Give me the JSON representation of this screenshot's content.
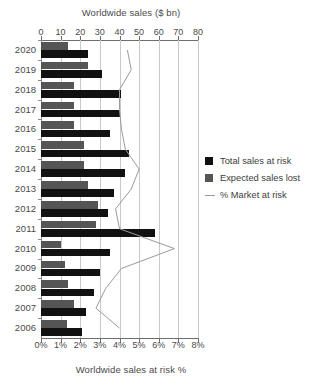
{
  "chart_data": {
    "type": "bar",
    "title": "",
    "orientation": "horizontal",
    "top_axis": {
      "label": "Worldwide sales ($ bn)",
      "ticks": [
        0,
        10,
        20,
        30,
        40,
        50,
        60,
        70,
        80
      ],
      "tick_labels": [
        "0",
        "10",
        "20",
        "30",
        "40",
        "50",
        "60",
        "70",
        "80"
      ],
      "range": [
        0,
        80
      ]
    },
    "bottom_axis": {
      "label": "Worldwide sales at risk %",
      "ticks": [
        0,
        1,
        2,
        3,
        4,
        5,
        6,
        7,
        8
      ],
      "tick_labels": [
        "0%",
        "1%",
        "2%",
        "3%",
        "4%",
        "5%",
        "6%",
        "7%",
        "8%"
      ],
      "range": [
        0,
        8
      ]
    },
    "categories": [
      "2020",
      "2019",
      "2018",
      "2017",
      "2016",
      "2015",
      "2014",
      "2013",
      "2012",
      "2011",
      "2010",
      "2009",
      "2008",
      "2007",
      "2006"
    ],
    "ylabel": "",
    "xlabel": "Worldwide sales ($ bn)",
    "grid": true,
    "legend_position": "right",
    "series": [
      {
        "name": "Total sales at risk",
        "type": "bar",
        "axis": "top",
        "color": "#111111",
        "unit": "$ bn",
        "values": [
          24,
          31,
          41,
          40,
          35,
          45,
          43,
          37,
          34,
          58,
          35,
          30,
          27,
          23,
          21
        ]
      },
      {
        "name": "Expected sales lost",
        "type": "bar",
        "axis": "top",
        "color": "#555555",
        "unit": "$ bn",
        "values": [
          14,
          24,
          17,
          17,
          17,
          22,
          22,
          24,
          29,
          28,
          10,
          12,
          14,
          17,
          13
        ]
      },
      {
        "name": "% Market at risk",
        "type": "line",
        "axis": "bottom",
        "color": "#9a9a9a",
        "unit": "%",
        "values": [
          4.4,
          4.6,
          4.0,
          4.0,
          4.1,
          4.3,
          5.0,
          4.6,
          3.8,
          4.0,
          6.8,
          4.1,
          3.3,
          2.8,
          4.0
        ]
      }
    ]
  },
  "legend": {
    "items": [
      {
        "label": "Total sales at risk",
        "swatch": "square",
        "color": "#111111"
      },
      {
        "label": "Expected sales lost",
        "swatch": "square",
        "color": "#555555"
      },
      {
        "label": "% Market at risk",
        "swatch": "line",
        "color": "#9a9a9a"
      }
    ]
  },
  "colors": {
    "total": "#111111",
    "expected": "#555555",
    "line": "#9a9a9a",
    "grid": "#c9c9c9",
    "axis": "#6e6e6e",
    "text": "#3c3c3c",
    "background": "#ffffff"
  }
}
